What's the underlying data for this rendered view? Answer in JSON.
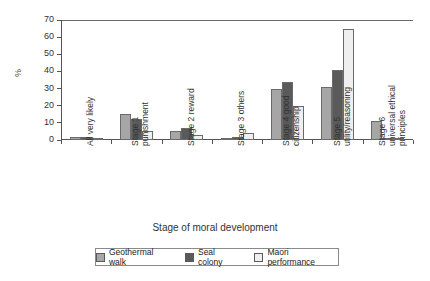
{
  "chart_data": {
    "type": "bar",
    "title": "",
    "xlabel": "Stage of moral development",
    "ylabel": "%",
    "ylim": [
      0,
      70
    ],
    "yticks": [
      0,
      10,
      20,
      30,
      40,
      50,
      60,
      70
    ],
    "grid": false,
    "legend_position": "bottom",
    "categories": [
      "All very likely",
      "Stage 1 punishment",
      "Stage 2 reward",
      "Stage 3 others",
      "Stage 4 good citizenship",
      "Stage 5 utility/reasoning",
      "Stage 6 universal ethical principles"
    ],
    "category_lines": [
      [
        "All very likely",
        ""
      ],
      [
        "Stage 1",
        "punishment"
      ],
      [
        "Stage 2 reward",
        ""
      ],
      [
        "Stage 3 others",
        ""
      ],
      [
        "Stage 4 good",
        "citizenship"
      ],
      [
        "Stage 5",
        "utility/reasoning"
      ],
      [
        "Stage 6",
        "universal ethical",
        "principles"
      ]
    ],
    "series": [
      {
        "name": "Geothermal walk",
        "color": "#a6a6a6",
        "values": [
          2,
          15,
          5,
          1,
          30,
          31,
          11
        ]
      },
      {
        "name": "Seal colony",
        "color": "#5a5a5a",
        "values": [
          2,
          12,
          7,
          2,
          34,
          41,
          1
        ]
      },
      {
        "name": "Maori performance",
        "color": "#efefef",
        "values": [
          1,
          5,
          3,
          4,
          20,
          65,
          0.5
        ]
      }
    ]
  }
}
